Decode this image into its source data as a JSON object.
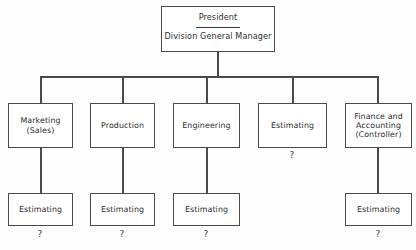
{
  "diagram": {
    "type": "organization-chart",
    "root": {
      "title": "President",
      "subtitle": "Division General Manager"
    },
    "departments": [
      {
        "id": "marketing",
        "lines": [
          "Marketing",
          "(Sales)"
        ],
        "child": {
          "label": "Estimating",
          "note": "?"
        },
        "note": ""
      },
      {
        "id": "production",
        "lines": [
          "Production"
        ],
        "child": {
          "label": "Estimating",
          "note": "?"
        },
        "note": ""
      },
      {
        "id": "engineering",
        "lines": [
          "Engineering"
        ],
        "child": {
          "label": "Estimating",
          "note": "?"
        },
        "note": ""
      },
      {
        "id": "estimating",
        "lines": [
          "Estimating"
        ],
        "child": null,
        "note": "?"
      },
      {
        "id": "finance-accounting",
        "lines": [
          "Finance and",
          "Accounting",
          "(Controller)"
        ],
        "child": {
          "label": "Estimating",
          "note": "?"
        },
        "note": ""
      }
    ],
    "colors": {
      "box_border": "#4a4a4a",
      "connector": "#4a4a4a",
      "text": "#2c2c2c",
      "background": "#fdfdfd"
    }
  }
}
